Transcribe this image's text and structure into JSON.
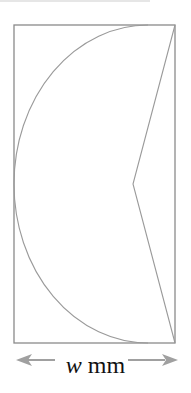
{
  "diagram": {
    "type": "geometry figure",
    "shapes": [
      "rectangle",
      "semicircular arc",
      "chevron"
    ],
    "stroke_color": "#8a8a8a",
    "arrow_color": "#a0a0a0"
  },
  "dimension": {
    "variable": "w",
    "unit": "mm"
  }
}
